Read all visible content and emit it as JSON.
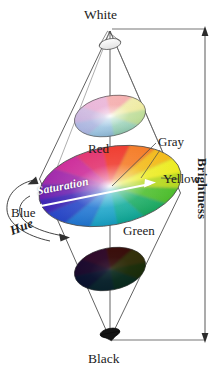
{
  "figure": {
    "type": "diagram",
    "background": "#ffffff",
    "ink_color": "#1c1c1c"
  },
  "labels": {
    "white": "White",
    "black": "Black",
    "red": "Red",
    "yellow": "Yellow",
    "green": "Green",
    "blue": "Blue",
    "gray": "Gray",
    "hue": "Hue",
    "saturation": "Saturation",
    "brightness": "Brightness"
  },
  "axes": {
    "brightness": {
      "label": "Brightness",
      "orientation": "vertical",
      "top_end": "White",
      "bottom_end": "Black",
      "arrow_heads": [
        "top",
        "bottom"
      ]
    },
    "hue": {
      "label": "Hue",
      "orientation": "circular",
      "arrow_heads": [
        "end"
      ],
      "description": "curved arrow sweeping around the cone circumference"
    },
    "saturation": {
      "label": "Saturation",
      "orientation": "radial",
      "arrow_heads": [
        "left",
        "right"
      ],
      "description": "double headed arrow across the widest color disk"
    }
  },
  "disks": [
    {
      "name": "upper-disk",
      "brightness_level": "high",
      "description": "pale desaturated color wheel near the white apex",
      "cx": 110,
      "cy": 116,
      "rx": 36,
      "ry": 20,
      "tilt": -11,
      "whiteness": 0.45,
      "blackness": 0.0
    },
    {
      "name": "main-disk",
      "brightness_level": "full",
      "description": "largest fully saturated color wheel at maximum brightness radius",
      "cx": 110,
      "cy": 186,
      "rx": 72,
      "ry": 39,
      "tilt": -11,
      "whiteness": 0.0,
      "blackness": 0.0
    },
    {
      "name": "lower-disk",
      "brightness_level": "low",
      "description": "dark dim color wheel near the black apex",
      "cx": 110,
      "cy": 269,
      "rx": 36,
      "ry": 21,
      "tilt": -11,
      "whiteness": 0.0,
      "blackness": 0.55
    }
  ],
  "hue_wheel": {
    "description": "hue angles around each disk rim, 0 deg at top going clockwise",
    "stops": [
      {
        "angle": 0,
        "name": "Red",
        "hex": "#e81a1a"
      },
      {
        "angle": 45,
        "name": "Orange",
        "hex": "#f0a515"
      },
      {
        "angle": 75,
        "name": "Yellow",
        "hex": "#ece81c"
      },
      {
        "angle": 120,
        "name": "Green",
        "hex": "#36b033"
      },
      {
        "angle": 180,
        "name": "Cyan",
        "hex": "#17b6c8"
      },
      {
        "angle": 225,
        "name": "Blue",
        "hex": "#1b56c4"
      },
      {
        "angle": 280,
        "name": "Violet",
        "hex": "#6d28b8"
      },
      {
        "angle": 320,
        "name": "Magenta",
        "hex": "#cc1f96"
      }
    ],
    "center": {
      "name": "Gray",
      "hex": "#bdbdbd"
    }
  },
  "apexes": {
    "top": {
      "name": "White",
      "x": 110,
      "y": 30,
      "fill": "#ffffff"
    },
    "bottom": {
      "name": "Black",
      "x": 110,
      "y": 340,
      "fill": "#111111"
    }
  }
}
